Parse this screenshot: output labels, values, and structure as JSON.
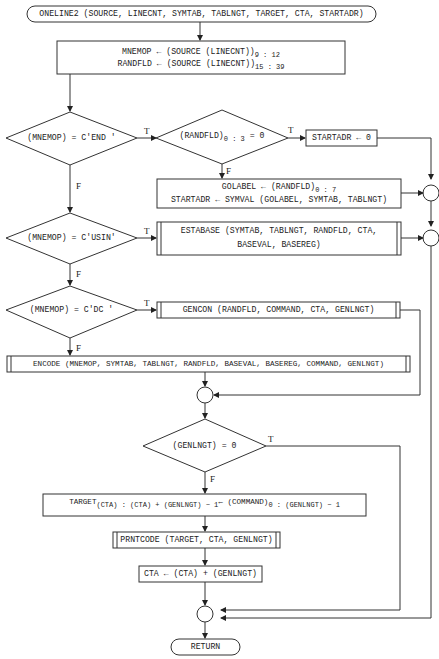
{
  "flowchart": {
    "start": "ONELINE2 (SOURCE, LINECNT, SYMTAB, TABLNGT, TARGET, CTA, STARTADR)",
    "init": {
      "line1_pre": "MNEMOP ← (SOURCE (LINECNT))",
      "line1_sub": "9 : 12",
      "line2_pre": "RANDFLD ← (SOURCE (LINECNT))",
      "line2_sub": "15 : 39"
    },
    "dec_end": "(MNEMOP) = C'END '",
    "dec_randfld_pre": "(RANDFLD)",
    "dec_randfld_sub": "0 : 3",
    "dec_randfld_post": "= 0",
    "startadr_zero": "STARTADR ← 0",
    "golabel": {
      "line1_pre": "GOLABEL ← (RANDFLD)",
      "line1_sub": "0 : 7",
      "line2": "STARTADR ← SYMVAL (GOLABEL, SYMTAB, TABLNGT)"
    },
    "dec_usin": "(MNEMOP) = C'USIN'",
    "estabase": {
      "line1": "ESTABASE (SYMTAB, TABLNGT, RANDFLD, CTA,",
      "line2": "BASEVAL, BASEREG)"
    },
    "dec_dc": "(MNEMOP) = C'DC '",
    "gencon": "GENCON (RANDFLD, COMMAND, CTA, GENLNGT)",
    "encode": "ENCODE (MNEMOP, SYMTAB, TABLNGT, RANDFLD, BASEVAL, BASEREG, COMMAND, GENLNGT)",
    "dec_genlngt": "(GENLNGT) = 0",
    "target_assign": {
      "a": "TARGET",
      "a_sub": "(CTA) : (CTA) + (GENLNGT) − 1",
      "b": "← (COMMAND)",
      "b_sub": "0 : (GENLNGT) − 1"
    },
    "prntcode": "PRNTCODE (TARGET, CTA, GENLNGT)",
    "cta_update": "CTA ← (CTA) + (GENLNGT)",
    "end": "RETURN",
    "labels": {
      "true": "T",
      "false": "F"
    }
  }
}
